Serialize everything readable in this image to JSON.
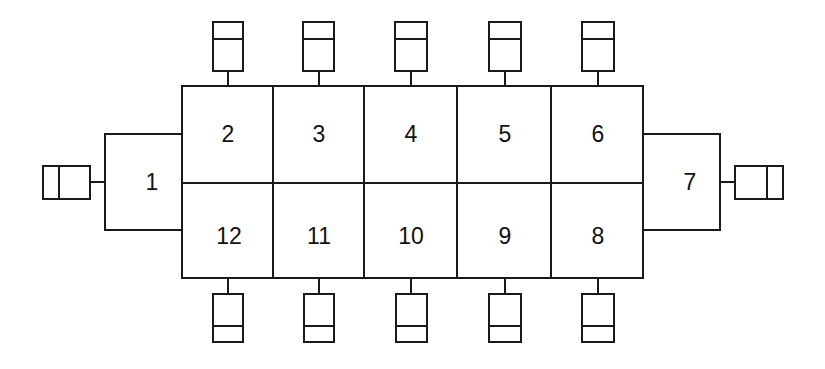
{
  "diagram": {
    "type": "block-layout",
    "stroke_color": "#1a1a1a",
    "background": "#ffffff",
    "left_block": {
      "label": "1"
    },
    "right_block": {
      "label": "7"
    },
    "grid": {
      "top_row": [
        "2",
        "3",
        "4",
        "5",
        "6"
      ],
      "bottom_row": [
        "12",
        "11",
        "10",
        "9",
        "8"
      ]
    },
    "modules": {
      "top_count": 5,
      "bottom_count": 5,
      "left_count": 1,
      "right_count": 1,
      "icon": "split-rectangle-module-icon"
    }
  }
}
